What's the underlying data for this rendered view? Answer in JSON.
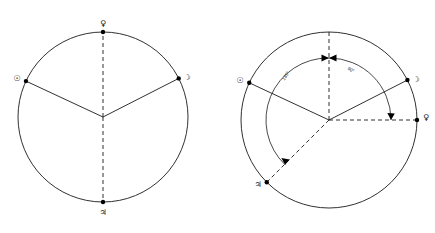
{
  "figure": {
    "background_color": "#ffffff",
    "line_color": "#1a1a1a",
    "panel_count": 2
  },
  "glyphs": {
    "sun": "☉",
    "moon": "☽",
    "venus": "♀",
    "jupiter": "♃"
  },
  "panels": [
    {
      "id": "left-panel",
      "name": "aspect-circle-plain",
      "center": {
        "x": 103,
        "y": 117
      },
      "radius": 85,
      "bodies": [
        {
          "name": "venus",
          "glyph": "♀",
          "angle_deg": 90,
          "label_dx": 0,
          "label_dy": -9,
          "marker": "filled"
        },
        {
          "name": "sun",
          "glyph": "☉",
          "angle_deg": 155,
          "label_dx": -9,
          "label_dy": -3,
          "marker": "filled"
        },
        {
          "name": "moon",
          "glyph": "☽",
          "angle_deg": 27,
          "label_dx": 9,
          "label_dy": -1,
          "marker": "filled"
        },
        {
          "name": "jupiter",
          "glyph": "♃",
          "angle_deg": 270,
          "label_dx": 0,
          "label_dy": 10,
          "marker": "filled"
        }
      ],
      "solid_rays": [
        "sun",
        "moon"
      ],
      "dashed_rays": [
        "venus",
        "jupiter"
      ],
      "angle_marks": []
    },
    {
      "id": "right-panel",
      "name": "aspect-circle-measured",
      "center": {
        "x": 329,
        "y": 120
      },
      "radius": 88,
      "bodies": [
        {
          "name": "sun",
          "glyph": "☉",
          "angle_deg": 155,
          "label_dx": -9,
          "label_dy": -3,
          "marker": "filled"
        },
        {
          "name": "moon",
          "glyph": "☽",
          "angle_deg": 27,
          "label_dx": 9,
          "label_dy": -1,
          "marker": "filled"
        },
        {
          "name": "venus",
          "glyph": "♀",
          "angle_deg": 0,
          "label_dx": 8,
          "label_dy": -3,
          "marker": "filled"
        },
        {
          "name": "jupiter",
          "glyph": "♃",
          "angle_deg": 225,
          "label_dx": -9,
          "label_dy": 2,
          "marker": "filled"
        }
      ],
      "solid_rays": [
        "sun",
        "moon"
      ],
      "dashed_rays": [
        "venus",
        "jupiter"
      ],
      "reference_axis": {
        "name": "vertical-reference",
        "angle_deg": 90,
        "style": "dashed"
      },
      "angle_marks": [
        {
          "name": "angle-135",
          "label": "135°",
          "value": 135,
          "unit": "degrees",
          "start_angle_deg": 90,
          "end_angle_deg": 225,
          "arc_radius": 62,
          "label_angle_deg": 148,
          "label_radius": 58,
          "label_rotation_deg": -58,
          "arrow_at": "end"
        },
        {
          "name": "angle-90",
          "label": "90°",
          "value": 90,
          "unit": "degrees",
          "start_angle_deg": 90,
          "end_angle_deg": 0,
          "arc_radius": 62,
          "label_angle_deg": 62,
          "label_radius": 58,
          "label_rotation_deg": 28,
          "arrow_at": "end"
        }
      ]
    }
  ],
  "legend": {
    "sun_name": "Sun",
    "moon_name": "Moon",
    "venus_name": "Venus",
    "jupiter_name": "Jupiter"
  }
}
